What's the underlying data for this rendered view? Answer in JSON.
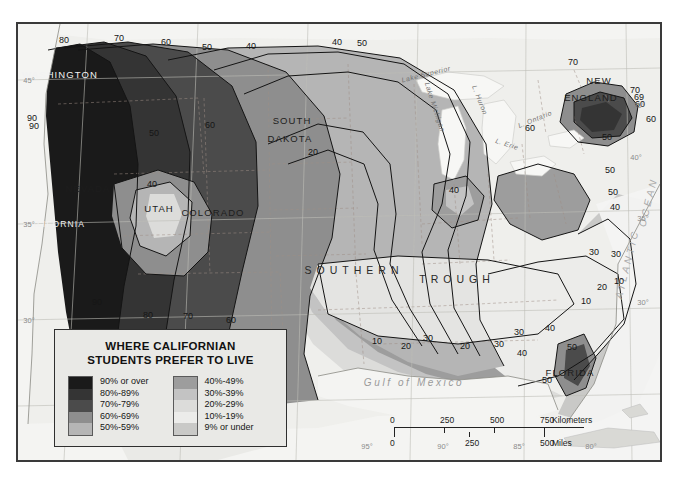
{
  "map": {
    "title_note": "isoline map of residential preference",
    "place_labels": [
      {
        "text": "WASHINGTON",
        "x": 58,
        "y": 72,
        "class": "light",
        "size": 9.5
      },
      {
        "text": "NEVADA",
        "x": 86,
        "y": 186,
        "class": "",
        "size": 9.5
      },
      {
        "text": "UTAH",
        "x": 157,
        "y": 206,
        "class": "",
        "size": 9.5
      },
      {
        "text": "COLORADO",
        "x": 211,
        "y": 210,
        "class": "",
        "size": 9.5
      },
      {
        "text": "CALIFORNIA",
        "x": 52,
        "y": 222,
        "class": "light",
        "size": 8.5
      },
      {
        "text": "SOUTH",
        "x": 290,
        "y": 118,
        "class": "",
        "size": 9.5
      },
      {
        "text": "DAKOTA",
        "x": 288,
        "y": 136,
        "class": "",
        "size": 9.5
      },
      {
        "text": "NEW",
        "x": 597,
        "y": 78,
        "class": "",
        "size": 9.5
      },
      {
        "text": "ENGLAND",
        "x": 589,
        "y": 95,
        "class": "",
        "size": 9.5
      },
      {
        "text": "FLORIDA",
        "x": 568,
        "y": 370,
        "class": "",
        "size": 9.5
      }
    ],
    "lake_labels": [
      {
        "text": "Lake Superior",
        "x": 424,
        "y": 72,
        "rot": -14
      },
      {
        "text": "Lake Michigan",
        "x": 433,
        "y": 105,
        "rot": 72
      },
      {
        "text": "L. Huron",
        "x": 478,
        "y": 98,
        "rot": 68
      },
      {
        "text": "L. Erie",
        "x": 505,
        "y": 142,
        "rot": 18
      },
      {
        "text": "L. Ontario",
        "x": 533,
        "y": 117,
        "rot": -22
      }
    ],
    "region_labels": [
      {
        "text": "Gulf of Mexico",
        "x": 412,
        "y": 380
      },
      {
        "text": "SOUTHERN",
        "x": 352,
        "y": 268
      },
      {
        "text": "TROUGH",
        "x": 455,
        "y": 277
      },
      {
        "text": "ATLANTIC",
        "x": 625,
        "y": 262,
        "rot": -76
      },
      {
        "text": "OCEAN",
        "x": 646,
        "y": 200,
        "rot": -76
      }
    ],
    "contour_labels": [
      {
        "v": "80",
        "x": 62,
        "y": 38
      },
      {
        "v": "70",
        "x": 117,
        "y": 36
      },
      {
        "v": "60",
        "x": 164,
        "y": 40
      },
      {
        "v": "50",
        "x": 205,
        "y": 45
      },
      {
        "v": "40",
        "x": 249,
        "y": 44
      },
      {
        "v": "40",
        "x": 335,
        "y": 40
      },
      {
        "v": "50",
        "x": 360,
        "y": 41
      },
      {
        "v": "70",
        "x": 571,
        "y": 60
      },
      {
        "v": "70",
        "x": 633,
        "y": 88
      },
      {
        "v": "60",
        "x": 638,
        "y": 102
      },
      {
        "v": "69",
        "x": 637,
        "y": 95
      },
      {
        "v": "60",
        "x": 649,
        "y": 117
      },
      {
        "v": "90",
        "x": 30,
        "y": 116
      },
      {
        "v": "90",
        "x": 32,
        "y": 124
      },
      {
        "v": "50",
        "x": 152,
        "y": 131
      },
      {
        "v": "60",
        "x": 208,
        "y": 123
      },
      {
        "v": "60",
        "x": 528,
        "y": 126
      },
      {
        "v": "50",
        "x": 605,
        "y": 135
      },
      {
        "v": "20",
        "x": 311,
        "y": 150
      },
      {
        "v": "40",
        "x": 150,
        "y": 182
      },
      {
        "v": "40",
        "x": 452,
        "y": 188
      },
      {
        "v": "50",
        "x": 608,
        "y": 168
      },
      {
        "v": "50",
        "x": 611,
        "y": 190
      },
      {
        "v": "40",
        "x": 613,
        "y": 205
      },
      {
        "v": "30",
        "x": 592,
        "y": 250
      },
      {
        "v": "30",
        "x": 614,
        "y": 252
      },
      {
        "v": "10",
        "x": 617,
        "y": 279
      },
      {
        "v": "20",
        "x": 600,
        "y": 285
      },
      {
        "v": "10",
        "x": 584,
        "y": 299
      },
      {
        "v": "90",
        "x": 95,
        "y": 300
      },
      {
        "v": "80",
        "x": 146,
        "y": 313
      },
      {
        "v": "70",
        "x": 186,
        "y": 314
      },
      {
        "v": "60",
        "x": 229,
        "y": 318
      },
      {
        "v": "30",
        "x": 426,
        "y": 336
      },
      {
        "v": "20",
        "x": 404,
        "y": 344
      },
      {
        "v": "10",
        "x": 375,
        "y": 339
      },
      {
        "v": "20",
        "x": 463,
        "y": 344
      },
      {
        "v": "30",
        "x": 497,
        "y": 342
      },
      {
        "v": "40",
        "x": 520,
        "y": 351
      },
      {
        "v": "40",
        "x": 548,
        "y": 326
      },
      {
        "v": "50",
        "x": 570,
        "y": 345
      },
      {
        "v": "30",
        "x": 517,
        "y": 330
      },
      {
        "v": "50",
        "x": 545,
        "y": 378
      },
      {
        "v": "40",
        "x": 241,
        "y": 380
      }
    ],
    "graticule_labels": [
      {
        "text": "45°",
        "x": 27,
        "y": 78
      },
      {
        "text": "35°",
        "x": 27,
        "y": 222
      },
      {
        "text": "30°",
        "x": 27,
        "y": 318
      },
      {
        "text": "40°",
        "x": 634,
        "y": 155
      },
      {
        "text": "35°",
        "x": 641,
        "y": 216
      },
      {
        "text": "30°",
        "x": 641,
        "y": 300
      },
      {
        "text": "30°",
        "x": 637,
        "y": 103
      },
      {
        "text": "95°",
        "x": 365,
        "y": 444
      },
      {
        "text": "90°",
        "x": 441,
        "y": 444
      },
      {
        "text": "85°",
        "x": 517,
        "y": 444
      },
      {
        "text": "80°",
        "x": 589,
        "y": 444
      }
    ]
  },
  "legend": {
    "title_line1": "WHERE CALIFORNIAN",
    "title_line2": "STUDENTS PREFER TO LIVE",
    "column1": [
      {
        "label": "90% or over",
        "color": "#1a1a1a"
      },
      {
        "label": "80%-89%",
        "color": "#343434"
      },
      {
        "label": "70%-79%",
        "color": "#4b4b4b"
      },
      {
        "label": "60%-69%",
        "color": "#8e8e8e"
      },
      {
        "label": "50%-59%",
        "color": "#b5b5b5"
      }
    ],
    "column2": [
      {
        "label": "40%-49%",
        "color": "#9d9d9d"
      },
      {
        "label": "30%-39%",
        "color": "#c3c3c3"
      },
      {
        "label": "20%-29%",
        "color": "#dcdcda"
      },
      {
        "label": "10%-19%",
        "color": "#ececea"
      },
      {
        "label": "9% or under",
        "color": "#c9c9c7"
      }
    ]
  },
  "scale": {
    "km": {
      "ticks": [
        "0",
        "250",
        "500",
        "750"
      ],
      "unit": "Kilometers"
    },
    "mi": {
      "ticks": [
        "0",
        "250",
        "500"
      ],
      "unit": "Miles"
    }
  }
}
